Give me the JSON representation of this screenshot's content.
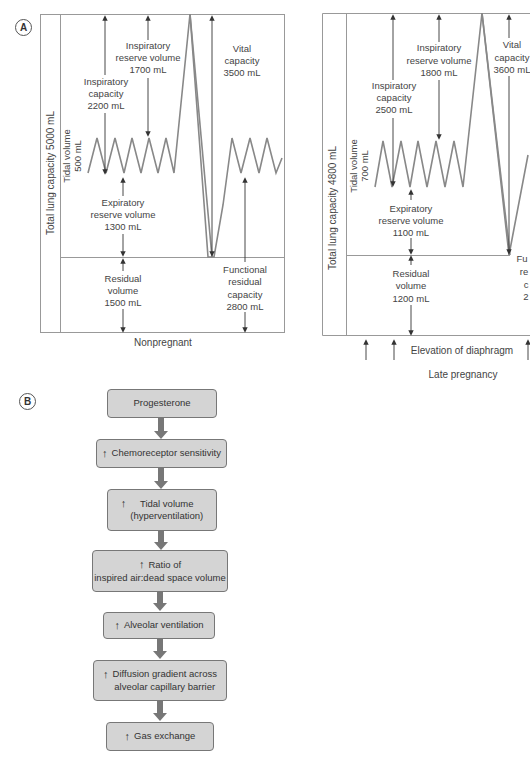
{
  "panels": {
    "a": {
      "letter": "A",
      "nonpregnant": {
        "caption": "Nonpregnant",
        "total_lung_capacity": "Total lung capacity 5000 mL",
        "tidal_volume": [
          "Tidal volume",
          "500 mL"
        ],
        "inspiratory_capacity": [
          "Inspiratory",
          "capacity",
          "2200 mL"
        ],
        "inspiratory_reserve_volume": [
          "Inspiratory",
          "reserve volume",
          "1700 mL"
        ],
        "vital_capacity": [
          "Vital",
          "capacity",
          "3500 mL"
        ],
        "expiratory_reserve_volume": [
          "Expiratory",
          "reserve volume",
          "1300 mL"
        ],
        "functional_residual_capacity": [
          "Functional",
          "residual",
          "capacity",
          "2800 mL"
        ],
        "residual_volume": [
          "Residual",
          "volume",
          "1500 mL"
        ]
      },
      "late_pregnancy": {
        "caption": "Late pregnancy",
        "total_lung_capacity": "Total lung capacity 4800 mL",
        "tidal_volume": [
          "Tidal volume",
          "700 mL"
        ],
        "inspiratory_capacity": [
          "Inspiratory",
          "capacity",
          "2500 mL"
        ],
        "inspiratory_reserve_volume": [
          "Inspiratory",
          "reserve volume",
          "1800 mL"
        ],
        "vital_capacity": [
          "Vital",
          "capacity",
          "3600 mL"
        ],
        "expiratory_reserve_volume": [
          "Expiratory",
          "reserve volume",
          "1100 mL"
        ],
        "functional_residual_capacity_partial": [
          "Fu",
          "re",
          "c",
          "2"
        ],
        "residual_volume": [
          "Residual",
          "volume",
          "1200 mL"
        ],
        "diaphragm_note": "Elevation of diaphragm"
      }
    },
    "b": {
      "letter": "B",
      "arrow_glyph": "↑",
      "steps": [
        {
          "text": "Progesterone",
          "increase": false
        },
        {
          "text": "Chemoreceptor sensitivity",
          "increase": true
        },
        {
          "text": "Tidal volume\n(hyperventilation)",
          "lines": [
            "Tidal volume",
            "(hyperventilation)"
          ],
          "increase": true
        },
        {
          "text": "Ratio of\ninspired air:dead space volume",
          "lines": [
            "Ratio of",
            "inspired air:dead space volume"
          ],
          "increase": true
        },
        {
          "text": "Alveolar ventilation",
          "increase": true
        },
        {
          "text": "Diffusion gradient across\nalveolar capillary barrier",
          "lines": [
            "Diffusion gradient across",
            "alveolar capillary barrier"
          ],
          "increase": true
        },
        {
          "text": "Gas exchange",
          "increase": true
        }
      ]
    }
  },
  "colors": {
    "box_fill": "#d4d4d4",
    "box_border": "#777777",
    "arrow": "#777777",
    "line": "#888888",
    "text": "#333333"
  }
}
